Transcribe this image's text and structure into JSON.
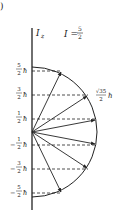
{
  "figure": {
    "panel_label": ")",
    "axis_label": "I",
    "axis_subscript": "z",
    "spin_equation": {
      "lhs": "I =",
      "num": "5",
      "den": "2"
    },
    "magnitude_label": {
      "num": "√35",
      "den": "2",
      "unit": "ħ"
    },
    "levels": [
      {
        "sign": "",
        "num": "5",
        "den": "2",
        "unit": "ħ"
      },
      {
        "sign": "",
        "num": "3",
        "den": "2",
        "unit": "ħ"
      },
      {
        "sign": "",
        "num": "1",
        "den": "2",
        "unit": "ħ"
      },
      {
        "sign": "−",
        "num": "1",
        "den": "2",
        "unit": "ħ"
      },
      {
        "sign": "−",
        "num": "3",
        "den": "2",
        "unit": "ħ"
      },
      {
        "sign": "−",
        "num": "5",
        "den": "2",
        "unit": "ħ"
      }
    ],
    "colors": {
      "ink": "#222222",
      "background": "#ffffff"
    }
  }
}
